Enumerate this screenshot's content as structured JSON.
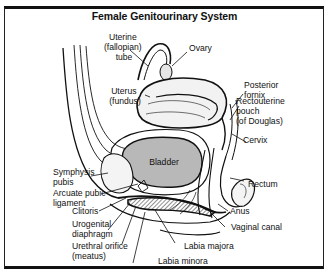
{
  "title": "Female Genitourinary System",
  "labels": {
    "fallopian_tube": [
      "Uterine",
      "(fallopian)",
      "tube"
    ],
    "ovary": [
      "Ovary"
    ],
    "uterus": [
      "Uterus",
      "(fundus)"
    ],
    "posterior_fornix": [
      "Posterior",
      "fornix"
    ],
    "rectouterine_pouch": [
      "Rectouterine",
      "pouch",
      "(of Douglas)"
    ],
    "cervix": [
      "Cervix"
    ],
    "bladder": [
      "Bladder"
    ],
    "symphysis_pubis": [
      "Symphysis",
      "pubis"
    ],
    "arcuate_pubic_ligament": [
      "Arcuate pubic",
      "ligament"
    ],
    "clitoris": [
      "Clitoris"
    ],
    "urogenital_diaphragm": [
      "Urogenital",
      "diaphragm"
    ],
    "urethral_orifice": [
      "Urethral orifice",
      "(meatus)"
    ],
    "labia_minora": [
      "Labia minora"
    ],
    "labia_majora": [
      "Labia majora"
    ],
    "vaginal_canal": [
      "Vaginal canal"
    ],
    "anus": [
      "Anus"
    ],
    "rectum": [
      "Rectum"
    ]
  },
  "colors": {
    "ink": "#111111",
    "bladder_fill": "#b8b8b8",
    "tissue_fill": "#e6e6e6",
    "background": "#ffffff"
  }
}
